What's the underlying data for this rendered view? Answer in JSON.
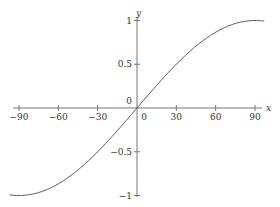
{
  "chart_data": {
    "type": "line",
    "title": "",
    "xlabel": "x",
    "ylabel": "y",
    "xlim": [
      -95,
      95
    ],
    "ylim": [
      -1,
      1
    ],
    "grid": false,
    "legend": null,
    "x_ticks": [
      -90,
      -60,
      -30,
      0,
      30,
      60,
      90
    ],
    "x_tick_labels": [
      "-90",
      "-60",
      "-30",
      "0",
      "30",
      "60",
      "90"
    ],
    "y_ticks": [
      -1,
      -0.5,
      0,
      0.5,
      1
    ],
    "y_tick_labels": [
      "-1",
      "-0.5",
      "0",
      "0.5",
      "1"
    ],
    "series": [
      {
        "name": "y = sin x",
        "x": [
          -90,
          -75,
          -60,
          -45,
          -30,
          -15,
          0,
          15,
          30,
          45,
          60,
          75,
          90
        ],
        "values": [
          -1,
          -0.966,
          -0.866,
          -0.707,
          -0.5,
          -0.259,
          0,
          0.259,
          0.5,
          0.707,
          0.866,
          0.966,
          1
        ],
        "color": "#555555"
      }
    ]
  },
  "colors": {
    "axis": "#777777",
    "curve": "#555555",
    "text": "#333333"
  }
}
